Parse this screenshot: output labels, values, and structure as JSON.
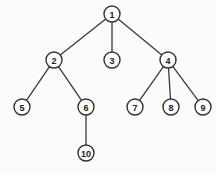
{
  "diagram": {
    "type": "tree",
    "colors": {
      "background": "#fbfbfb",
      "stroke": "#333333",
      "edge": "#3a3a3a",
      "node_fill": "#fdfdfd",
      "text": "#222222"
    },
    "node_radius": 8,
    "nodes": [
      {
        "id": "1",
        "label": "1",
        "x": 112,
        "y": 14
      },
      {
        "id": "2",
        "label": "2",
        "x": 54,
        "y": 60
      },
      {
        "id": "3",
        "label": "3",
        "x": 112,
        "y": 60
      },
      {
        "id": "4",
        "label": "4",
        "x": 168,
        "y": 60
      },
      {
        "id": "5",
        "label": "5",
        "x": 22,
        "y": 107
      },
      {
        "id": "6",
        "label": "6",
        "x": 86,
        "y": 107
      },
      {
        "id": "7",
        "label": "7",
        "x": 135,
        "y": 107
      },
      {
        "id": "8",
        "label": "8",
        "x": 171,
        "y": 107
      },
      {
        "id": "9",
        "label": "9",
        "x": 203,
        "y": 107
      },
      {
        "id": "10",
        "label": "10",
        "x": 86,
        "y": 153
      }
    ],
    "edges": [
      {
        "from": "1",
        "to": "2"
      },
      {
        "from": "1",
        "to": "3"
      },
      {
        "from": "1",
        "to": "4"
      },
      {
        "from": "2",
        "to": "5"
      },
      {
        "from": "2",
        "to": "6"
      },
      {
        "from": "4",
        "to": "7"
      },
      {
        "from": "4",
        "to": "8"
      },
      {
        "from": "4",
        "to": "9"
      },
      {
        "from": "6",
        "to": "10"
      }
    ]
  }
}
